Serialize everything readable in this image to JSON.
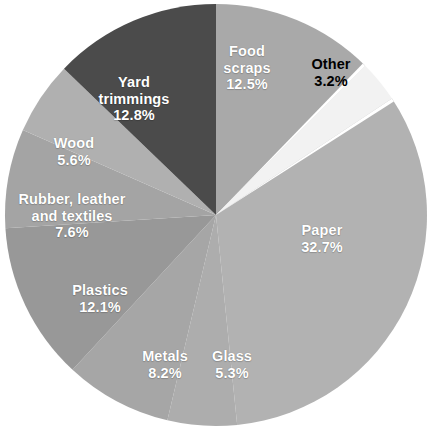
{
  "chart_data": {
    "type": "pie",
    "title": "",
    "subtitle": "",
    "xlabel": "",
    "ylabel": "",
    "unit": "%",
    "grid": false,
    "legend_position": "none",
    "labels_inside_slices": true,
    "start_angle_deg": 0,
    "direction": "clockwise",
    "total": 100.0,
    "categories": [
      "Food scraps",
      "Other",
      "Paper",
      "Glass",
      "Metals",
      "Plastics",
      "Rubber, leather and textiles",
      "Wood",
      "Yard trimmings"
    ],
    "values": [
      12.5,
      3.2,
      32.7,
      5.3,
      8.2,
      12.1,
      7.6,
      5.6,
      12.8
    ],
    "slices": [
      {
        "name": "Food scraps",
        "label_line1": "Food",
        "label_line2": "scraps",
        "value": 12.5,
        "value_text": "12.5%",
        "color": "#a9a9a9",
        "text_color": "#ffffff",
        "start_deg": 0.0,
        "end_deg": 45.0,
        "label_x": 247,
        "label_y": 68
      },
      {
        "name": "Other",
        "label_line1": "Other",
        "label_line2": "",
        "value": 3.2,
        "value_text": "3.2%",
        "color": "#f2f2f2",
        "text_color": "#000000",
        "start_deg": 45.0,
        "end_deg": 56.52,
        "label_x": 331,
        "label_y": 73
      },
      {
        "name": "Paper",
        "label_line1": "Paper",
        "label_line2": "",
        "value": 32.7,
        "value_text": "32.7%",
        "color": "#b2b2b2",
        "text_color": "#ffffff",
        "start_deg": 56.52,
        "end_deg": 174.24,
        "label_x": 322,
        "label_y": 239
      },
      {
        "name": "Glass",
        "label_line1": "Glass",
        "label_line2": "",
        "value": 5.3,
        "value_text": "5.3%",
        "color": "#adadad",
        "text_color": "#ffffff",
        "start_deg": 174.24,
        "end_deg": 193.32,
        "label_x": 232,
        "label_y": 365
      },
      {
        "name": "Metals",
        "label_line1": "Metals",
        "label_line2": "",
        "value": 8.2,
        "value_text": "8.2%",
        "color": "#a6a6a6",
        "text_color": "#ffffff",
        "start_deg": 193.32,
        "end_deg": 222.84,
        "label_x": 165,
        "label_y": 365
      },
      {
        "name": "Plastics",
        "label_line1": "Plastics",
        "label_line2": "",
        "value": 12.1,
        "value_text": "12.1%",
        "color": "#989898",
        "text_color": "#ffffff",
        "start_deg": 222.84,
        "end_deg": 266.4,
        "label_x": 100,
        "label_y": 299
      },
      {
        "name": "Rubber, leather and textiles",
        "label_line1": "Rubber, leather",
        "label_line2": "and textiles",
        "value": 7.6,
        "value_text": "7.6%",
        "color": "#a4a4a4",
        "text_color": "#ffffff",
        "start_deg": 266.4,
        "end_deg": 293.76,
        "label_x": 72,
        "label_y": 216
      },
      {
        "name": "Wood",
        "label_line1": "Wood",
        "label_line2": "",
        "value": 5.6,
        "value_text": "5.6%",
        "color": "#b0b0b0",
        "text_color": "#ffffff",
        "start_deg": 293.76,
        "end_deg": 313.92,
        "label_x": 74,
        "label_y": 152
      },
      {
        "name": "Yard trimmings",
        "label_line1": "Yard",
        "label_line2": "trimmings",
        "value": 12.8,
        "value_text": "12.8%",
        "color": "#4b4b4b",
        "text_color": "#ffffff",
        "start_deg": 313.92,
        "end_deg": 360.0,
        "label_x": 134,
        "label_y": 99
      }
    ],
    "geometry": {
      "center_x": 216,
      "center_y": 215,
      "radius": 211,
      "separator_color": "#ffffff",
      "separator_slice": "Other"
    },
    "background_color": "#ffffff"
  }
}
